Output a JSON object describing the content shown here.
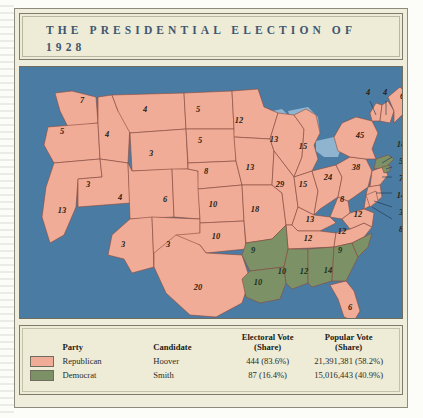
{
  "title": "THE PRESIDENTIAL ELECTION OF 1928",
  "colors": {
    "republican": "#f0ac96",
    "democrat": "#7d9167",
    "ocean": "#4a7ba3",
    "parchment": "#eeebd6",
    "title_text": "#3e5771"
  },
  "legend": {
    "headers": {
      "party": "Party",
      "candidate": "Candidate",
      "electoral": "Electoral Vote\n(Share)",
      "electoral_line1": "Electoral Vote",
      "electoral_line2": "(Share)",
      "popular_line1": "Popular Vote",
      "popular_line2": "(Share)"
    },
    "rows": [
      {
        "swatch": "republican-swatch",
        "party": "Republican",
        "candidate": "Hoover",
        "electoral": "444 (83.6%)",
        "popular": "21,391,381 (58.2%)"
      },
      {
        "swatch": "democrat-swatch",
        "party": "Democrat",
        "candidate": "Smith",
        "electoral": "87 (16.4%)",
        "popular": "15,016,443 (40.9%)"
      }
    ]
  },
  "chart_data": {
    "type": "map",
    "title": "The Presidential Election of 1928",
    "legend_position": "bottom",
    "series": [
      {
        "name": "Republican (Hoover)",
        "color": "#f0ac96",
        "electoral_votes": 444,
        "electoral_share": "83.6%",
        "popular_votes": "21,391,381",
        "popular_share": "58.2%"
      },
      {
        "name": "Democrat (Smith)",
        "color": "#7d9167",
        "electoral_votes": 87,
        "electoral_share": "16.4%",
        "popular_votes": "15,016,443",
        "popular_share": "40.9%"
      }
    ],
    "states": [
      {
        "code": "WA",
        "electoral": 7,
        "party": "republican",
        "x": 62,
        "y": 36
      },
      {
        "code": "OR",
        "electoral": 5,
        "party": "republican",
        "x": 42,
        "y": 67
      },
      {
        "code": "CA",
        "electoral": 13,
        "party": "republican",
        "x": 42,
        "y": 146
      },
      {
        "code": "ID",
        "electoral": 4,
        "party": "republican",
        "x": 87,
        "y": 70
      },
      {
        "code": "NV",
        "electoral": 3,
        "party": "republican",
        "x": 68,
        "y": 120
      },
      {
        "code": "MT",
        "electoral": 4,
        "party": "republican",
        "x": 125,
        "y": 45
      },
      {
        "code": "WY",
        "electoral": 3,
        "party": "republican",
        "x": 131,
        "y": 89
      },
      {
        "code": "UT",
        "electoral": 4,
        "party": "republican",
        "x": 100,
        "y": 133
      },
      {
        "code": "CO",
        "electoral": 6,
        "party": "republican",
        "x": 145,
        "y": 135
      },
      {
        "code": "AZ",
        "electoral": 3,
        "party": "republican",
        "x": 103,
        "y": 180
      },
      {
        "code": "NM",
        "electoral": 3,
        "party": "republican",
        "x": 148,
        "y": 180
      },
      {
        "code": "ND",
        "electoral": 5,
        "party": "republican",
        "x": 178,
        "y": 45
      },
      {
        "code": "SD",
        "electoral": 5,
        "party": "republican",
        "x": 180,
        "y": 76
      },
      {
        "code": "NE",
        "electoral": 8,
        "party": "republican",
        "x": 186,
        "y": 107
      },
      {
        "code": "KS",
        "electoral": 10,
        "party": "republican",
        "x": 193,
        "y": 140
      },
      {
        "code": "OK",
        "electoral": 10,
        "party": "republican",
        "x": 196,
        "y": 172
      },
      {
        "code": "TX",
        "electoral": 20,
        "party": "republican",
        "x": 178,
        "y": 223
      },
      {
        "code": "MN",
        "electoral": 12,
        "party": "republican",
        "x": 219,
        "y": 56
      },
      {
        "code": "IA",
        "electoral": 13,
        "party": "republican",
        "x": 230,
        "y": 103
      },
      {
        "code": "MO",
        "electoral": 18,
        "party": "republican",
        "x": 235,
        "y": 145
      },
      {
        "code": "AR",
        "electoral": 9,
        "party": "democrat",
        "x": 233,
        "y": 186
      },
      {
        "code": "LA",
        "electoral": 10,
        "party": "democrat",
        "x": 238,
        "y": 218
      },
      {
        "code": "WI",
        "electoral": 13,
        "party": "republican",
        "x": 254,
        "y": 75
      },
      {
        "code": "IL",
        "electoral": 29,
        "party": "republican",
        "x": 260,
        "y": 120
      },
      {
        "code": "MS",
        "electoral": 10,
        "party": "democrat",
        "x": 262,
        "y": 207
      },
      {
        "code": "MI",
        "electoral": 15,
        "party": "republican",
        "x": 283,
        "y": 82
      },
      {
        "code": "IN",
        "electoral": 15,
        "party": "republican",
        "x": 283,
        "y": 120
      },
      {
        "code": "KY",
        "electoral": 13,
        "party": "republican",
        "x": 290,
        "y": 155
      },
      {
        "code": "TN",
        "electoral": 12,
        "party": "republican",
        "x": 288,
        "y": 174
      },
      {
        "code": "AL",
        "electoral": 12,
        "party": "democrat",
        "x": 284,
        "y": 207
      },
      {
        "code": "OH",
        "electoral": 24,
        "party": "republican",
        "x": 308,
        "y": 113
      },
      {
        "code": "GA",
        "electoral": 14,
        "party": "democrat",
        "x": 308,
        "y": 206
      },
      {
        "code": "SC",
        "electoral": 9,
        "party": "democrat",
        "x": 320,
        "y": 186
      },
      {
        "code": "NC",
        "electoral": 12,
        "party": "republican",
        "x": 322,
        "y": 167
      },
      {
        "code": "WV",
        "electoral": 8,
        "party": "republican",
        "x": 322,
        "y": 135
      },
      {
        "code": "VA",
        "electoral": 12,
        "party": "republican",
        "x": 338,
        "y": 150
      },
      {
        "code": "FL",
        "electoral": 6,
        "party": "republican",
        "x": 330,
        "y": 243
      },
      {
        "code": "PA",
        "electoral": 38,
        "party": "republican",
        "x": 336,
        "y": 103
      },
      {
        "code": "NY",
        "electoral": 45,
        "party": "republican",
        "x": 340,
        "y": 71
      },
      {
        "code": "VT",
        "electoral": 4,
        "party": "republican",
        "x": 348,
        "y": 28
      },
      {
        "code": "NH",
        "electoral": 4,
        "party": "republican",
        "x": 365,
        "y": 28
      },
      {
        "code": "ME",
        "electoral": 6,
        "party": "republican",
        "x": 382,
        "y": 32
      },
      {
        "code": "MA",
        "electoral": 18,
        "party": "democrat",
        "x": 381,
        "y": 80
      },
      {
        "code": "RI",
        "electoral": 5,
        "party": "democrat",
        "x": 381,
        "y": 97
      },
      {
        "code": "CT",
        "electoral": 7,
        "party": "republican",
        "x": 381,
        "y": 114
      },
      {
        "code": "NJ",
        "electoral": 14,
        "party": "republican",
        "x": 381,
        "y": 131
      },
      {
        "code": "DE",
        "electoral": 3,
        "party": "republican",
        "x": 381,
        "y": 148
      },
      {
        "code": "MD",
        "electoral": 8,
        "party": "republican",
        "x": 381,
        "y": 165
      }
    ]
  }
}
